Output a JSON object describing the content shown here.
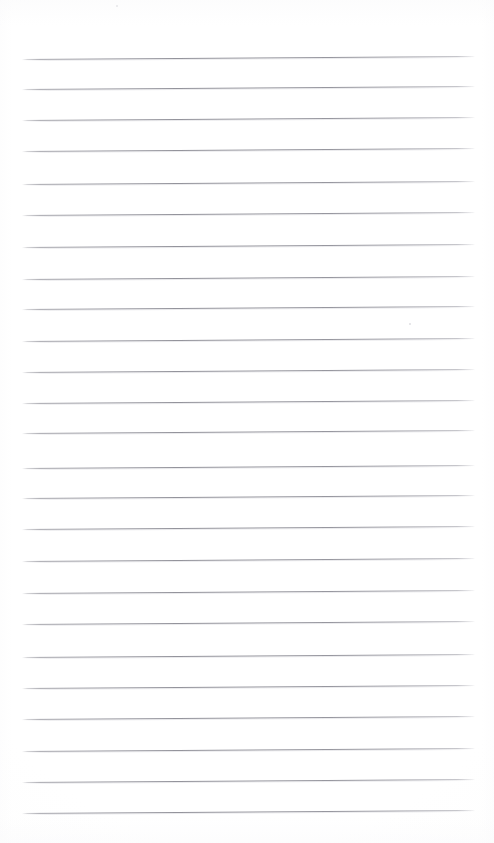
{
  "document": {
    "kind": "scanned-lined-paper",
    "title": "Blank Ruled Notepaper Scan",
    "page_width": 494,
    "page_height": 843,
    "background_color": "#ffffff",
    "content_text": "",
    "handwriting_text": "",
    "typed_text": ""
  },
  "ruling": {
    "line_color": "#92929a",
    "line_halo_color": "#cdcdd3",
    "line_thickness": 1,
    "line_count": 25,
    "first_line_y": 59,
    "line_spacing": 31.4,
    "left_x": 22,
    "right_x": 475,
    "tilt_degrees": -0.38,
    "line_y_positions": [
      59,
      89,
      120,
      151,
      184,
      215,
      247,
      279,
      309,
      341,
      372,
      403,
      433,
      468,
      498,
      529,
      561,
      593,
      624,
      657,
      688,
      719,
      751,
      782,
      813
    ]
  },
  "margins": {
    "top_blank_height": 59,
    "bottom_blank_height": 30,
    "left_blank_width": 22,
    "right_blank_width": 19,
    "has_vertical_margin_rule": false,
    "has_header_rule": false,
    "has_holes": false
  },
  "artifacts": {
    "specks": [
      {
        "name": "speck-top",
        "x": 116,
        "y": 5,
        "size": 2.2,
        "color": "#d8d8dc"
      },
      {
        "name": "speck-mid-right",
        "x": 409,
        "y": 323,
        "size": 1.8,
        "color": "#e0e0e4"
      }
    ]
  }
}
